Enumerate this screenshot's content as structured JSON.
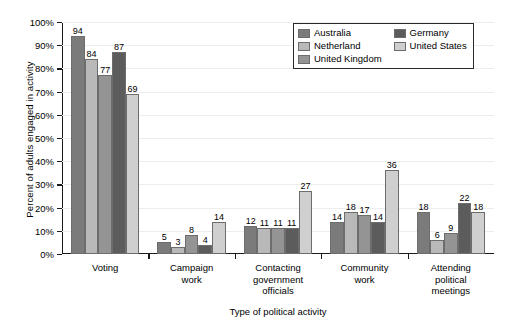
{
  "chart_data": {
    "type": "bar",
    "title": "",
    "xlabel": "Type of political activity",
    "ylabel": "Percent of adults engaged in activity",
    "ylim": [
      0,
      100
    ],
    "ytick_labels": [
      "0%",
      "10%",
      "20%",
      "30%",
      "40%",
      "50%",
      "60%",
      "70%",
      "80%",
      "90%",
      "100%"
    ],
    "ytick_values": [
      0,
      10,
      20,
      30,
      40,
      50,
      60,
      70,
      80,
      90,
      100
    ],
    "grid": true,
    "legend_position": "top-right",
    "categories": [
      "Voting",
      "Campaign\nwork",
      "Contacting\ngovernment\nofficials",
      "Community\nwork",
      "Attending\npolitical\nmeetings"
    ],
    "series": [
      {
        "name": "Australia",
        "color": "#7b7b7b",
        "values": [
          94,
          5,
          12,
          14,
          18
        ]
      },
      {
        "name": "Netherland",
        "color": "#b9b9b9",
        "values": [
          84,
          3,
          11,
          18,
          6
        ]
      },
      {
        "name": "United Kingdom",
        "color": "#949494",
        "values": [
          77,
          8,
          11,
          17,
          9
        ]
      },
      {
        "name": "Germany",
        "color": "#5c5c5c",
        "values": [
          87,
          4,
          11,
          14,
          22
        ]
      },
      {
        "name": "United States",
        "color": "#cfcfcf",
        "values": [
          69,
          14,
          27,
          36,
          18
        ]
      }
    ]
  }
}
